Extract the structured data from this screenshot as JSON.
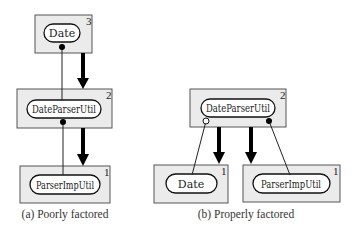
{
  "panels": [
    {
      "id": "a",
      "caption": "(a) Poorly factored",
      "modules": [
        {
          "name": "Date",
          "level": "3"
        },
        {
          "name": "DateParserUtil",
          "level": "2"
        },
        {
          "name": "ParserImpUtil",
          "level": "1"
        }
      ]
    },
    {
      "id": "b",
      "caption": "(b) Properly factored",
      "modules": [
        {
          "name": "DateParserUtil",
          "level": "2"
        },
        {
          "name": "Date",
          "level": "1"
        },
        {
          "name": "ParserImpUtil",
          "level": "1"
        }
      ]
    }
  ],
  "colors": {
    "box_fill": "#ebebeb",
    "pill_fill": "#ffffff",
    "arrow": "#000000"
  }
}
